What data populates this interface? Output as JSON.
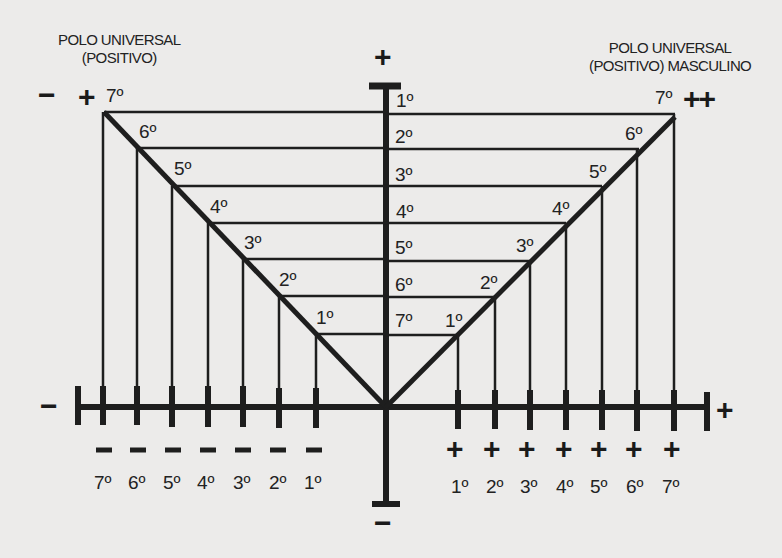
{
  "titles": {
    "left_line1": "POLO UNIVERSAL",
    "left_line2": "(POSITIVO)",
    "right_line1": "POLO UNIVERSAL",
    "right_line2": "(POSITIVO) MASCULINO"
  },
  "signs": {
    "top_axis": "+",
    "bottom_axis": "−",
    "left_axis": "−",
    "right_axis": "+",
    "top_left_minus": "−",
    "top_left_plus": "+",
    "top_right_plus_plus": "++"
  },
  "center_degrees": [
    "1º",
    "2º",
    "3º",
    "4º",
    "5º",
    "6º",
    "7º"
  ],
  "left_diagonal_degrees": [
    "7º",
    "6º",
    "5º",
    "4º",
    "3º",
    "2º",
    "1º"
  ],
  "right_diagonal_degrees": [
    "1º",
    "2º",
    "3º",
    "4º",
    "5º",
    "6º",
    "7º"
  ],
  "bottom_left": {
    "sign": "−",
    "degrees": [
      "7º",
      "6º",
      "5º",
      "4º",
      "3º",
      "2º",
      "1º"
    ]
  },
  "bottom_right": {
    "sign": "+",
    "degrees": [
      "1º",
      "2º",
      "3º",
      "4º",
      "5º",
      "6º",
      "7º"
    ]
  },
  "colors": {
    "background": "#ecebea",
    "ink": "#1e1e1e"
  }
}
